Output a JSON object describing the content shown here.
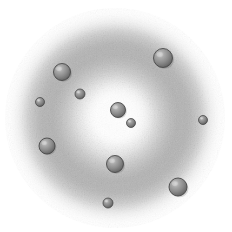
{
  "figure": {
    "kind": "grayscale-scientific-illustration",
    "canvas": {
      "width": 232,
      "height": 232,
      "background": "#ffffff"
    },
    "cloud": {
      "name": "diffuse-halo",
      "center_x": 115,
      "center_y": 118,
      "outer_radius": 108,
      "inner_bright_radius": 34,
      "mid_band_radius": 74,
      "core_color": "#fdfdfd",
      "mid_color": "#c9c9c9",
      "band_color": "#bcbcbc",
      "edge_color": "#ffffff",
      "grain": "speckled",
      "grain_opacity": 0.5
    },
    "palette": {
      "sphere_fill": "#8e8e8e",
      "sphere_rim": "#4a4a4a",
      "sphere_highlight": "#d8d8d8",
      "sphere_shadow": "#5a5a5a",
      "background": "#ffffff",
      "ink": "#333333"
    },
    "particles": [
      {
        "id": "sphere-top-right",
        "label": "large sphere, upper right",
        "cx": 163,
        "cy": 58,
        "r": 9.5,
        "size": "large"
      },
      {
        "id": "sphere-upper-left",
        "label": "large sphere, upper left",
        "cx": 62,
        "cy": 72,
        "r": 8.5,
        "size": "large"
      },
      {
        "id": "sphere-left-small",
        "label": "small sphere, left",
        "cx": 40,
        "cy": 102,
        "r": 4.5,
        "size": "small"
      },
      {
        "id": "sphere-inner-upper",
        "label": "small sphere, inner upper",
        "cx": 80,
        "cy": 94,
        "r": 5.0,
        "size": "small"
      },
      {
        "id": "sphere-lower-left",
        "label": "large sphere, lower left",
        "cx": 47,
        "cy": 146,
        "r": 8.0,
        "size": "large"
      },
      {
        "id": "sphere-center",
        "label": "central sphere",
        "cx": 118,
        "cy": 110,
        "r": 7.5,
        "size": "medium"
      },
      {
        "id": "sphere-center-small",
        "label": "small sphere beside center",
        "cx": 131,
        "cy": 123,
        "r": 4.5,
        "size": "small"
      },
      {
        "id": "sphere-lower-center",
        "label": "large sphere, lower center",
        "cx": 115,
        "cy": 164,
        "r": 8.5,
        "size": "large"
      },
      {
        "id": "sphere-bottom-right",
        "label": "large sphere, bottom right",
        "cx": 178,
        "cy": 187,
        "r": 9.0,
        "size": "large"
      },
      {
        "id": "sphere-right-small",
        "label": "small sphere, right edge",
        "cx": 203,
        "cy": 120,
        "r": 4.5,
        "size": "small"
      },
      {
        "id": "sphere-bottom-small",
        "label": "small sphere, bottom",
        "cx": 108,
        "cy": 203,
        "r": 5.0,
        "size": "small"
      }
    ],
    "counts": {
      "total_particles": 11,
      "large": 6,
      "medium": 1,
      "small": 4
    }
  }
}
